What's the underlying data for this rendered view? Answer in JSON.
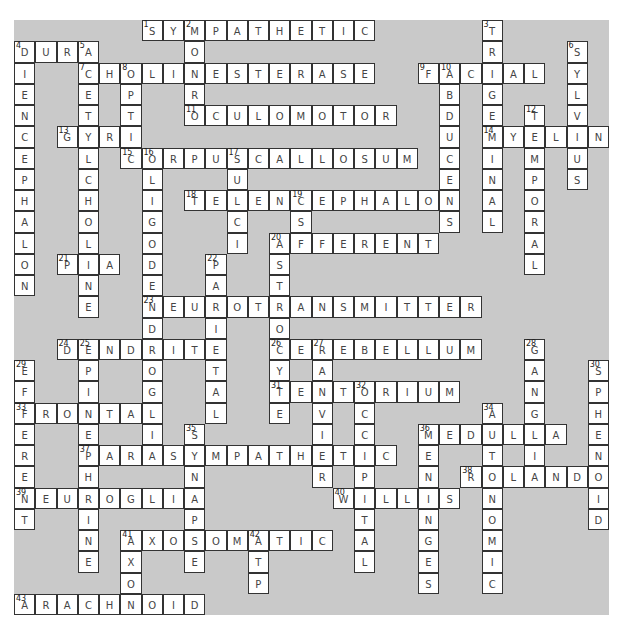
{
  "puzzle": {
    "title": "Nervous System Crossword",
    "cols": 28,
    "rows": 28,
    "colors": {
      "background": "#c9c9c9",
      "cell": "#ffffff",
      "border": "#333333",
      "text": "#444444"
    },
    "across": [
      {
        "num": 1,
        "word": "SYMPATHETIC",
        "col": 6,
        "row": 0
      },
      {
        "num": 4,
        "word": "DURA",
        "col": 0,
        "row": 1
      },
      {
        "num": 7,
        "word": "CHOLINESTERASE",
        "col": 3,
        "row": 2
      },
      {
        "num": 9,
        "word": "FACIAL",
        "col": 19,
        "row": 2
      },
      {
        "num": 11,
        "word": "OCULOMOTOR",
        "col": 8,
        "row": 4
      },
      {
        "num": 13,
        "word": "GYRI",
        "col": 2,
        "row": 5
      },
      {
        "num": 14,
        "word": "MYELIN",
        "col": 22,
        "row": 5
      },
      {
        "num": 15,
        "word": "CORPUSCALLOSUM",
        "col": 5,
        "row": 6
      },
      {
        "num": 18,
        "word": "TELENCEPHALON",
        "col": 8,
        "row": 8
      },
      {
        "num": 20,
        "word": "AFFERENT",
        "col": 12,
        "row": 10
      },
      {
        "num": 21,
        "word": "PIA",
        "col": 2,
        "row": 11
      },
      {
        "num": 23,
        "word": "NEUROTRANSMITTER",
        "col": 6,
        "row": 13
      },
      {
        "num": 24,
        "word": "DENDRITE",
        "col": 2,
        "row": 15
      },
      {
        "num": 26,
        "word": "CEREBELLUM",
        "col": 12,
        "row": 15
      },
      {
        "num": 31,
        "word": "TENTORIUM",
        "col": 12,
        "row": 17
      },
      {
        "num": 33,
        "word": "FRONTAL",
        "col": 0,
        "row": 18
      },
      {
        "num": 36,
        "word": "MEDULLA",
        "col": 19,
        "row": 19
      },
      {
        "num": 37,
        "word": "PARASYMPATHETIC",
        "col": 3,
        "row": 20
      },
      {
        "num": 38,
        "word": "ROLANDO",
        "col": 21,
        "row": 21
      },
      {
        "num": 39,
        "word": "NEUROGLIA",
        "col": 0,
        "row": 22
      },
      {
        "num": 40,
        "word": "WILLIS",
        "col": 15,
        "row": 22
      },
      {
        "num": 41,
        "word": "AXOSOMATIC",
        "col": 5,
        "row": 24
      },
      {
        "num": 43,
        "word": "ARACHNOID",
        "col": 0,
        "row": 27
      }
    ],
    "down": [
      {
        "num": 2,
        "word": "MONRO",
        "col": 8,
        "row": 0
      },
      {
        "num": 3,
        "word": "TRIGEMINAL",
        "col": 22,
        "row": 0
      },
      {
        "num": 4,
        "word": "DIENCEPHALON",
        "col": 0,
        "row": 1
      },
      {
        "num": 5,
        "word": "ACETYLCHOLINE",
        "col": 3,
        "row": 1
      },
      {
        "num": 6,
        "word": "SYLVIUS",
        "col": 26,
        "row": 1
      },
      {
        "num": 8,
        "word": "OPTIC",
        "col": 5,
        "row": 2
      },
      {
        "num": 10,
        "word": "ABDUCENS",
        "col": 20,
        "row": 2
      },
      {
        "num": 12,
        "word": "TEMPORAL",
        "col": 24,
        "row": 4
      },
      {
        "num": 16,
        "word": "OLIGODENDROGLIA",
        "col": 6,
        "row": 6
      },
      {
        "num": 17,
        "word": "SULCI",
        "col": 10,
        "row": 6
      },
      {
        "num": 19,
        "word": "CSF",
        "col": 13,
        "row": 8
      },
      {
        "num": 20,
        "word": "ASTROCYTE",
        "col": 12,
        "row": 10
      },
      {
        "num": 22,
        "word": "PARIETAL",
        "col": 9,
        "row": 11
      },
      {
        "num": 25,
        "word": "EPINEPHRINE",
        "col": 3,
        "row": 15
      },
      {
        "num": 27,
        "word": "RANVIER",
        "col": 14,
        "row": 15
      },
      {
        "num": 28,
        "word": "GANGLIA",
        "col": 24,
        "row": 15
      },
      {
        "num": 29,
        "word": "EFFERENT",
        "col": 0,
        "row": 16
      },
      {
        "num": 30,
        "word": "SPHENOID",
        "col": 27,
        "row": 16
      },
      {
        "num": 32,
        "word": "OCCIPITAL",
        "col": 16,
        "row": 17
      },
      {
        "num": 34,
        "word": "AUTONOMIC",
        "col": 22,
        "row": 18
      },
      {
        "num": 35,
        "word": "SYNAPSE",
        "col": 8,
        "row": 19
      },
      {
        "num": 36,
        "word": "MENINGES",
        "col": 19,
        "row": 19
      },
      {
        "num": 41,
        "word": "AXON",
        "col": 5,
        "row": 24
      },
      {
        "num": 42,
        "word": "ATP",
        "col": 11,
        "row": 24
      }
    ]
  }
}
